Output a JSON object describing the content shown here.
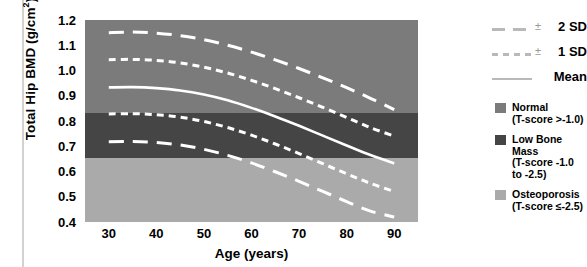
{
  "axes": {
    "ylabel_main": "Total Hip BMD (g/cm",
    "ylabel_sup": "2",
    "ylabel_tail": ")",
    "xlabel": "Age (years)",
    "yticks": [
      "1.2",
      "1.1",
      "1.0",
      "0.9",
      "0.8",
      "0.7",
      "0.6",
      "0.5",
      "0.4"
    ],
    "xticks": [
      "30",
      "40",
      "50",
      "60",
      "70",
      "80",
      "90"
    ]
  },
  "legend": {
    "lines": [
      {
        "name": "2 SD",
        "pm": "±",
        "label": "2 SD",
        "style": "long-dash"
      },
      {
        "name": "1 SD",
        "pm": "±",
        "label": "1 SD",
        "style": "short-dash"
      },
      {
        "name": "Mean",
        "pm": "",
        "label": "Mean",
        "style": "solid"
      }
    ],
    "swatches": [
      {
        "line1": "Normal",
        "line2": "(T-score >-1.0)",
        "line3": "",
        "color": "#7b7b7b"
      },
      {
        "line1": "Low Bone Mass",
        "line2": "(T-score -1.0",
        "line3": "to -2.5)",
        "color": "#454545"
      },
      {
        "line1": "Osteoporosis",
        "line2": "(T-score ≤-2.5)",
        "line3": "",
        "color": "#aaaaaa"
      }
    ]
  },
  "bands": {
    "normal": {
      "label": "Normal",
      "color": "#7b7b7b",
      "from": 0.83,
      "to": 1.2
    },
    "low_bone_mass": {
      "label": "Low Bone Mass",
      "color": "#454545",
      "from": 0.655,
      "to": 0.83
    },
    "osteoporosis": {
      "label": "Osteoporosis",
      "color": "#aaaaaa",
      "from": 0.4,
      "to": 0.655
    }
  },
  "chart_data": {
    "type": "line",
    "title": "",
    "xlabel": "Age (years)",
    "ylabel": "Total Hip BMD (g/cm2)",
    "xlim": [
      25,
      95
    ],
    "ylim": [
      0.4,
      1.2
    ],
    "grid": false,
    "legend_position": "right",
    "x": [
      30,
      35,
      40,
      45,
      50,
      55,
      60,
      65,
      70,
      75,
      80,
      85,
      90
    ],
    "series": [
      {
        "name": "+2 SD",
        "style": "long-dash",
        "color": "#ffffff",
        "values": [
          1.15,
          1.152,
          1.148,
          1.138,
          1.122,
          1.1,
          1.073,
          1.042,
          1.008,
          0.971,
          0.932,
          0.89,
          0.845
        ]
      },
      {
        "name": "+1 SD",
        "style": "short-dash",
        "color": "#ffffff",
        "values": [
          1.043,
          1.044,
          1.04,
          1.03,
          1.013,
          0.99,
          0.961,
          0.928,
          0.892,
          0.854,
          0.814,
          0.774,
          0.74
        ]
      },
      {
        "name": "Mean",
        "style": "solid",
        "color": "#ffffff",
        "values": [
          0.933,
          0.934,
          0.93,
          0.921,
          0.905,
          0.882,
          0.852,
          0.818,
          0.781,
          0.742,
          0.703,
          0.665,
          0.632
        ]
      },
      {
        "name": "-1 SD",
        "style": "short-dash",
        "color": "#ffffff",
        "values": [
          0.828,
          0.829,
          0.825,
          0.815,
          0.798,
          0.774,
          0.744,
          0.709,
          0.671,
          0.631,
          0.591,
          0.553,
          0.521
        ]
      },
      {
        "name": "-2 SD",
        "style": "long-dash",
        "color": "#ffffff",
        "values": [
          0.718,
          0.719,
          0.715,
          0.705,
          0.688,
          0.664,
          0.634,
          0.599,
          0.561,
          0.521,
          0.481,
          0.443,
          0.42
        ]
      }
    ],
    "annotations": [
      {
        "text": "Normal (T-score >-1.0)",
        "type": "band",
        "y_from": 0.83,
        "y_to": 1.2
      },
      {
        "text": "Low Bone Mass (T-score -1.0 to -2.5)",
        "type": "band",
        "y_from": 0.655,
        "y_to": 0.83
      },
      {
        "text": "Osteoporosis (T-score ≤-2.5)",
        "type": "band",
        "y_from": 0.4,
        "y_to": 0.655
      }
    ]
  }
}
